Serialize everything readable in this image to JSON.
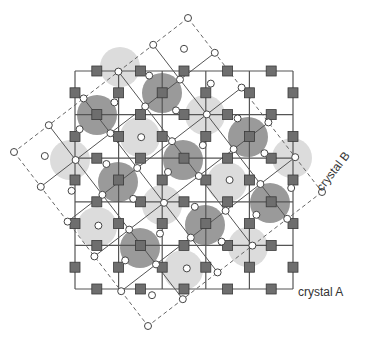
{
  "figure": {
    "width": 366,
    "height": 345,
    "labels": {
      "crystal_a": "crystal A",
      "crystal_b": "crystal B"
    },
    "colors": {
      "background": "#ffffff",
      "line": "#555555",
      "dashed_line": "#666666",
      "square_fill": "#6e6e6e",
      "square_stroke": "#3a3a3a",
      "circle_fill": "#ffffff",
      "circle_stroke": "#444444",
      "dark_disc": "#9a9a9a",
      "light_disc": "#dcdcdc",
      "label": "#333333"
    },
    "crystal_a": {
      "origin": [
        75,
        71
      ],
      "pitch": 43.6,
      "cells": 5,
      "atom": "filled-square"
    },
    "crystal_b": {
      "top_corner": [
        188,
        18
      ],
      "u": [
        -34.8,
        26.8
      ],
      "v": [
        26.8,
        34.8
      ],
      "cells": 5,
      "atom": "open-circle"
    },
    "dark_discs": [
      [
        97,
        115
      ],
      [
        162,
        93
      ],
      [
        248,
        137
      ],
      [
        183,
        160
      ],
      [
        118,
        182
      ],
      [
        270,
        203
      ],
      [
        205,
        225
      ],
      [
        140,
        248
      ]
    ],
    "light_discs": [
      [
        120,
        67
      ],
      [
        140,
        137
      ],
      [
        205,
        115
      ],
      [
        70,
        160
      ],
      [
        227,
        182
      ],
      [
        292,
        158
      ],
      [
        162,
        205
      ],
      [
        97,
        227
      ],
      [
        248,
        247
      ],
      [
        183,
        270
      ]
    ],
    "disc_radius": 20,
    "label_positions": {
      "crystal_a": [
        298,
        296
      ],
      "crystal_b": [
        322,
        192
      ]
    }
  }
}
